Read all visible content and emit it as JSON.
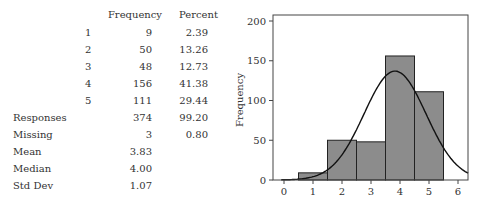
{
  "table": {
    "headers": {
      "frequency": "Frequency",
      "percent": "Percent"
    },
    "rows": [
      {
        "label": "1",
        "frequency": "9",
        "percent": "2.39"
      },
      {
        "label": "2",
        "frequency": "50",
        "percent": "13.26"
      },
      {
        "label": "3",
        "frequency": "48",
        "percent": "12.73"
      },
      {
        "label": "4",
        "frequency": "156",
        "percent": "41.38"
      },
      {
        "label": "5",
        "frequency": "111",
        "percent": "29.44"
      }
    ],
    "summary": [
      {
        "label": "Responses",
        "frequency": "374",
        "percent": "99.20"
      },
      {
        "label": "Missing",
        "frequency": "3",
        "percent": "0.80"
      },
      {
        "label": "Mean",
        "frequency": "3.83",
        "percent": ""
      },
      {
        "label": "Median",
        "frequency": "4.00",
        "percent": ""
      },
      {
        "label": "Std Dev",
        "frequency": "1.07",
        "percent": ""
      }
    ]
  },
  "chart_data": {
    "type": "bar",
    "title": "",
    "xlabel": "",
    "ylabel": "Frequency",
    "categories": [
      "1",
      "2",
      "3",
      "4",
      "5"
    ],
    "values": [
      9,
      50,
      48,
      156,
      111
    ],
    "overlay": {
      "type": "normal_curve",
      "mean": 3.83,
      "std": 1.07,
      "peak_approx": 137
    },
    "xlim": [
      -0.3,
      6.3
    ],
    "ylim": [
      0,
      210
    ],
    "xticks": [
      "0",
      "1",
      "2",
      "3",
      "4",
      "5",
      "6"
    ],
    "yticks": [
      "0",
      "50",
      "100",
      "150",
      "200"
    ],
    "grid": false,
    "legend": "none",
    "colors": {
      "bar_fill": "#8c8c8c",
      "bar_edge": "#222222",
      "curve": "#111111"
    }
  }
}
